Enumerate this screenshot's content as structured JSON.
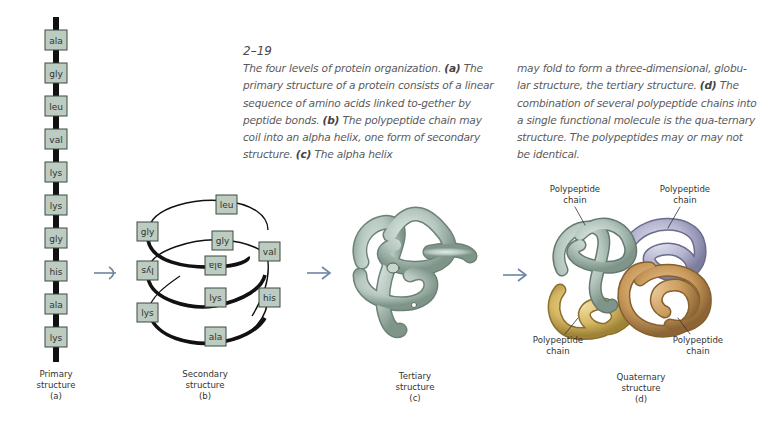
{
  "figure": {
    "number": "2–19",
    "caption_col1": [
      {
        "text": "The four levels of protein organization. ",
        "bold": false
      },
      {
        "text": "(a)",
        "bold": true
      },
      {
        "text": " The primary structure of a protein consists of a linear sequence of amino acids linked to-gether by peptide bonds. ",
        "bold": false
      },
      {
        "text": "(b)",
        "bold": true
      },
      {
        "text": " The polypeptide chain may coil into an alpha helix, one form of secondary structure. ",
        "bold": false
      },
      {
        "text": "(c)",
        "bold": true
      },
      {
        "text": " The alpha helix",
        "bold": false
      }
    ],
    "caption_col2": [
      {
        "text": "may fold to form a three-dimensional, globu-lar structure, the tertiary structure. ",
        "bold": false
      },
      {
        "text": "(d)",
        "bold": true
      },
      {
        "text": " The combination of several polypeptide chains into a single functional molecule is the qua-ternary structure. The polypeptides may or may not be identical.",
        "bold": false
      }
    ],
    "caption_lines_col1": [
      "The four levels of protein organization.",
      "primary structure of a protein consists of a",
      "linear sequence of amino acids linked to-",
      "gether by peptide bonds.",
      "chain may coil into an alpha helix, one form",
      "of secondary structure.",
      "The alpha helix"
    ]
  },
  "primary": {
    "residues": [
      "ala",
      "gly",
      "leu",
      "val",
      "lys",
      "lys",
      "gly",
      "his",
      "ala",
      "lys"
    ],
    "label_line1": "Primary",
    "label_line2": "structure",
    "label_line3": "(a)"
  },
  "secondary": {
    "residues": [
      "leu",
      "gly",
      "gly",
      "val",
      "ala",
      "lys",
      "lys",
      "his",
      "lys",
      "ala"
    ],
    "label_line1": "Secondary",
    "label_line2": "structure",
    "label_line3": "(b)"
  },
  "tertiary": {
    "label_line1": "Tertiary",
    "label_line2": "structure",
    "label_line3": "(c)"
  },
  "quaternary": {
    "chain_labels": [
      {
        "line1": "Polypeptide",
        "line2": "chain"
      },
      {
        "line1": "Polypeptide",
        "line2": "chain"
      },
      {
        "line1": "Polypeptide",
        "line2": "chain"
      },
      {
        "line1": "Polypeptide",
        "line2": "chain"
      }
    ],
    "label_line1": "Quaternary",
    "label_line2": "structure",
    "label_line3": "(d)"
  },
  "colors": {
    "residue_fill": "#bcccc1",
    "residue_stroke": "#3d4a43",
    "backbone": "#111111",
    "arrow": "#6e84a3",
    "chain_green": "#b4c6bd",
    "chain_purple": "#b3b3cf",
    "chain_yellow": "#d6b865",
    "chain_orange": "#c99a5c"
  }
}
